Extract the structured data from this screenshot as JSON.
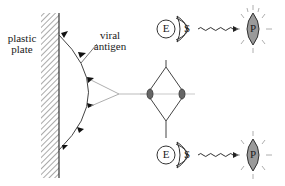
{
  "labels": {
    "plate": [
      "plastic",
      "plate"
    ],
    "antigen": [
      "viral",
      "antigen"
    ]
  },
  "nodes": {
    "enzyme": "E",
    "substrate": "S",
    "product": "P"
  },
  "colors": {
    "stroke": "#333333",
    "product_fill": "#9a9a9a",
    "background": "#ffffff"
  }
}
